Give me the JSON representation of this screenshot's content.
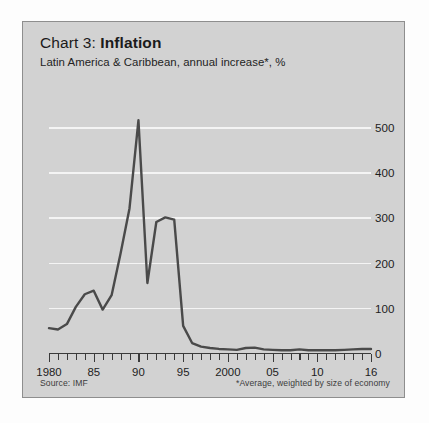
{
  "card": {
    "title_prefix": "Chart 3: ",
    "title_strong": "Inflation",
    "subtitle": "Latin America & Caribbean, annual increase*, %",
    "source_note": "Source: IMF",
    "average_note": "*Average, weighted by size of economy",
    "panel_color": "#d2d2d2",
    "line_color": "#4a4a4a",
    "gridline_color": "#f4f4f4"
  },
  "chart_data": {
    "type": "line",
    "title": "Chart 3: Inflation",
    "subtitle": "Latin America & Caribbean, annual increase*, %",
    "xlabel": "",
    "ylabel": "%",
    "ylim": [
      0,
      540
    ],
    "xlim": [
      1980,
      2016
    ],
    "grid": true,
    "y_axis_position": "right",
    "legend": "none",
    "yticks": [
      0,
      100,
      200,
      300,
      400,
      500
    ],
    "ytick_labels": [
      "0",
      "100",
      "200",
      "300",
      "400",
      "500"
    ],
    "xticks": [
      1980,
      1985,
      1990,
      1995,
      2000,
      2005,
      2010,
      2016
    ],
    "xtick_labels": [
      "1980",
      "85",
      "90",
      "95",
      "2000",
      "05",
      "10",
      "16"
    ],
    "x": [
      1980,
      1981,
      1982,
      1983,
      1984,
      1985,
      1986,
      1987,
      1988,
      1989,
      1990,
      1991,
      1992,
      1993,
      1994,
      1995,
      1996,
      1997,
      1998,
      1999,
      2000,
      2001,
      2002,
      2003,
      2004,
      2005,
      2006,
      2007,
      2008,
      2009,
      2010,
      2011,
      2012,
      2013,
      2014,
      2015,
      2016
    ],
    "values": [
      55,
      52,
      64,
      102,
      130,
      138,
      96,
      128,
      220,
      320,
      515,
      155,
      290,
      300,
      295,
      60,
      22,
      14,
      11,
      9,
      8,
      7,
      11,
      12,
      8,
      7,
      6,
      6,
      8,
      6,
      6,
      6,
      6,
      7,
      8,
      9,
      9
    ],
    "series": [
      {
        "name": "Latin America & Caribbean annual inflation",
        "values": [
          55,
          52,
          64,
          102,
          130,
          138,
          96,
          128,
          220,
          320,
          515,
          155,
          290,
          300,
          295,
          60,
          22,
          14,
          11,
          9,
          8,
          7,
          11,
          12,
          8,
          7,
          6,
          6,
          8,
          6,
          6,
          6,
          6,
          7,
          8,
          9,
          9
        ]
      }
    ],
    "annotations": [
      {
        "text": "Peak hyperinflation",
        "x": 1990,
        "y": 515
      },
      {
        "text": "Source: IMF"
      },
      {
        "text": "*Average, weighted by size of economy"
      }
    ]
  }
}
